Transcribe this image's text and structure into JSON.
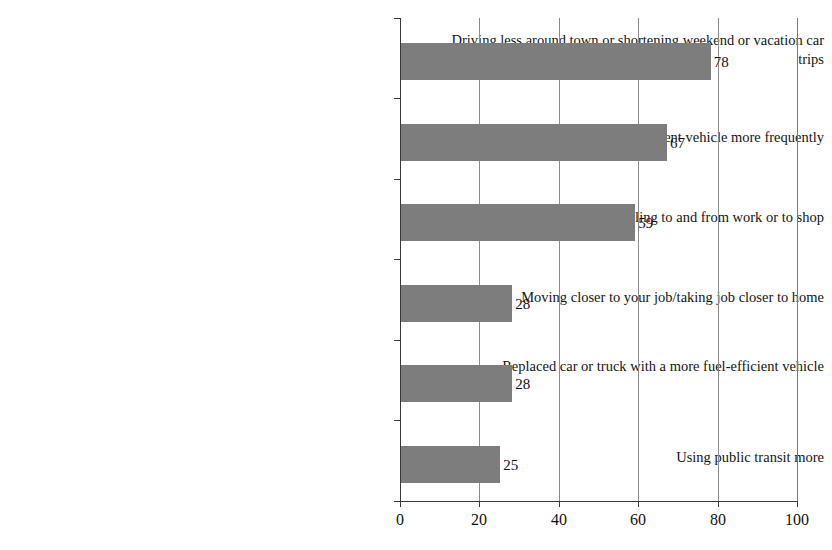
{
  "chart_data": {
    "type": "bar",
    "orientation": "horizontal",
    "title": "",
    "subtitle": "",
    "xlabel": "",
    "ylabel": "",
    "xlim": [
      0,
      100
    ],
    "grid": true,
    "legend": null,
    "xticks": [
      "0",
      "20",
      "40",
      "60",
      "80",
      "100"
    ],
    "xtick_values": [
      0,
      20,
      40,
      60,
      80,
      100
    ],
    "categories": [
      "Driving less around town or shortening weekend or vacation car trips",
      "Using your fuel efficient vehicle more frequently",
      "Carpooling to and from work or to shop",
      "Moving closer to your job/taking job closer to home",
      "Replaced car or truck with a more fuel-efficient vehicle",
      "Using public transit more"
    ],
    "values": [
      78,
      67,
      59,
      28,
      28,
      25
    ],
    "value_labels": [
      "78",
      "67",
      "59",
      "28",
      "28",
      "25"
    ],
    "bar_color": "#7d7d7d",
    "axis_color": "#3a3a3a",
    "gridline_color": "#8d8d8d"
  }
}
